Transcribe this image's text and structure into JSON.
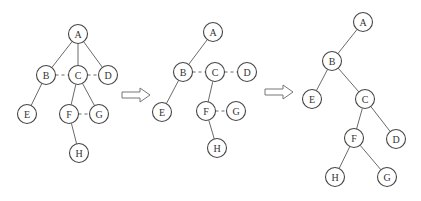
{
  "diagram": {
    "trees": [
      {
        "id": "original-tree",
        "nodes": [
          "A",
          "B",
          "C",
          "D",
          "E",
          "F",
          "G",
          "H"
        ],
        "edges": [
          {
            "from": "A",
            "to": "B",
            "style": "solid"
          },
          {
            "from": "A",
            "to": "C",
            "style": "solid"
          },
          {
            "from": "A",
            "to": "D",
            "style": "solid"
          },
          {
            "from": "B",
            "to": "C",
            "style": "dashed"
          },
          {
            "from": "C",
            "to": "D",
            "style": "dashed"
          },
          {
            "from": "B",
            "to": "E",
            "style": "solid"
          },
          {
            "from": "C",
            "to": "F",
            "style": "solid"
          },
          {
            "from": "C",
            "to": "G",
            "style": "solid"
          },
          {
            "from": "F",
            "to": "G",
            "style": "dashed"
          },
          {
            "from": "F",
            "to": "H",
            "style": "solid"
          }
        ]
      },
      {
        "id": "intermediate-tree",
        "nodes": [
          "A",
          "B",
          "C",
          "D",
          "E",
          "F",
          "G",
          "H"
        ],
        "edges": [
          {
            "from": "A",
            "to": "B",
            "style": "solid"
          },
          {
            "from": "B",
            "to": "C",
            "style": "dashed"
          },
          {
            "from": "C",
            "to": "D",
            "style": "dashed"
          },
          {
            "from": "B",
            "to": "E",
            "style": "solid"
          },
          {
            "from": "C",
            "to": "F",
            "style": "solid"
          },
          {
            "from": "F",
            "to": "G",
            "style": "dashed"
          },
          {
            "from": "F",
            "to": "H",
            "style": "solid"
          }
        ]
      },
      {
        "id": "binary-tree",
        "nodes": [
          "A",
          "B",
          "C",
          "D",
          "E",
          "F",
          "G",
          "H"
        ],
        "edges": [
          {
            "from": "A",
            "to": "B",
            "style": "solid"
          },
          {
            "from": "B",
            "to": "E",
            "style": "solid"
          },
          {
            "from": "B",
            "to": "C",
            "style": "solid"
          },
          {
            "from": "C",
            "to": "F",
            "style": "solid"
          },
          {
            "from": "C",
            "to": "D",
            "style": "solid"
          },
          {
            "from": "F",
            "to": "H",
            "style": "solid"
          },
          {
            "from": "F",
            "to": "G",
            "style": "solid"
          }
        ]
      }
    ],
    "arrows": [
      {
        "from": "original-tree",
        "to": "intermediate-tree",
        "icon": "hollow-right-arrow"
      },
      {
        "from": "intermediate-tree",
        "to": "binary-tree",
        "icon": "hollow-right-arrow"
      }
    ]
  }
}
